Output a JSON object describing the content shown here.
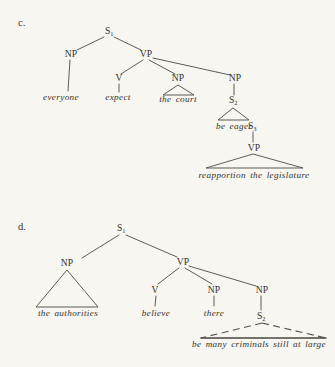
{
  "page": {
    "background_color": "#f7f6f1",
    "ink_color": "#33322c"
  },
  "tree_c": {
    "label": "c.",
    "nodes": {
      "s1_base": "S",
      "s1_sub": "1",
      "np_subject": "NP",
      "vp": "VP",
      "v": "V",
      "np_object": "NP",
      "np_complement": "NP",
      "s2_base": "S",
      "s2_sub": "2",
      "s3_base": "S",
      "s3_sub": "3",
      "vp_lower": "VP"
    },
    "terminals": {
      "subject": "everyone",
      "verb": "expect",
      "object_phrase": "the court",
      "s2_phrase": "be eager",
      "vp_lower_phrase": "reapportion the legislature"
    }
  },
  "tree_d": {
    "label": "d.",
    "nodes": {
      "s1_base": "S",
      "s1_sub": "1",
      "np_subject": "NP",
      "vp": "VP",
      "v": "V",
      "np_object": "NP",
      "np_complement": "NP",
      "s2_base": "S",
      "s2_sub": "2"
    },
    "terminals": {
      "subject_phrase": "the authorities",
      "verb": "believe",
      "object": "there",
      "s2_phrase": "be many criminals still at large"
    }
  }
}
